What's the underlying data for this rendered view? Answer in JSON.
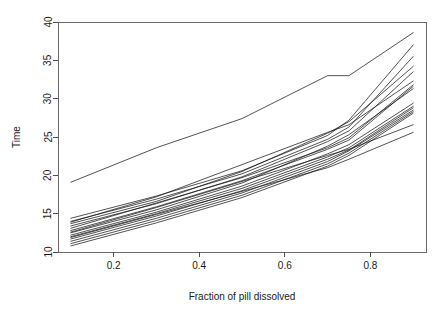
{
  "chart_data": {
    "type": "line",
    "title": "",
    "subtitle": "",
    "xlabel": "Fraction of pill dissolved",
    "ylabel": "Time",
    "xlim": [
      0.07,
      0.93
    ],
    "ylim": [
      10,
      40
    ],
    "xticks": [
      0.2,
      0.4,
      0.6,
      0.8
    ],
    "xticklabels": [
      "0.2",
      "0.4",
      "0.6",
      "0.8"
    ],
    "yticks": [
      10,
      15,
      20,
      25,
      30,
      35,
      40
    ],
    "yticklabels": [
      "10",
      "15",
      "20",
      "25",
      "30",
      "35",
      "40"
    ],
    "grid": false,
    "legend": null,
    "legend_position": "none",
    "box": true,
    "annotations": [],
    "x": [
      0.1,
      0.3,
      0.5,
      0.7,
      0.75,
      0.9
    ],
    "series": [
      {
        "name": "subject-01",
        "values": [
          19.1,
          23.6,
          27.4,
          33.0,
          33.0,
          38.6
        ]
      },
      {
        "name": "subject-02",
        "values": [
          14.4,
          17.3,
          20.6,
          25.2,
          27.2,
          37.0
        ]
      },
      {
        "name": "subject-03",
        "values": [
          14.0,
          16.9,
          20.2,
          24.7,
          26.3,
          35.5
        ]
      },
      {
        "name": "subject-04",
        "values": [
          13.7,
          16.6,
          20.5,
          25.5,
          27.0,
          34.2
        ]
      },
      {
        "name": "subject-05",
        "values": [
          13.4,
          16.3,
          19.8,
          24.4,
          25.8,
          33.5
        ]
      },
      {
        "name": "subject-06",
        "values": [
          13.9,
          17.2,
          21.4,
          25.6,
          26.6,
          32.3
        ]
      },
      {
        "name": "subject-07",
        "values": [
          13.1,
          16.4,
          19.7,
          23.6,
          24.9,
          31.8
        ]
      },
      {
        "name": "subject-08",
        "values": [
          12.8,
          15.9,
          19.3,
          23.4,
          24.6,
          31.6
        ]
      },
      {
        "name": "subject-09",
        "values": [
          12.5,
          15.5,
          19.0,
          23.8,
          25.3,
          31.3
        ]
      },
      {
        "name": "subject-10",
        "values": [
          12.2,
          15.2,
          18.6,
          22.8,
          24.0,
          29.4
        ]
      },
      {
        "name": "subject-11",
        "values": [
          12.0,
          15.0,
          18.3,
          22.4,
          23.6,
          29.0
        ]
      },
      {
        "name": "subject-12",
        "values": [
          11.7,
          14.7,
          18.0,
          22.1,
          23.3,
          28.8
        ]
      },
      {
        "name": "subject-13",
        "values": [
          11.4,
          14.4,
          17.7,
          21.8,
          23.2,
          28.5
        ]
      },
      {
        "name": "subject-14",
        "values": [
          11.1,
          14.1,
          17.4,
          21.5,
          22.9,
          28.3
        ]
      },
      {
        "name": "subject-15",
        "values": [
          12.6,
          15.8,
          19.2,
          22.6,
          23.4,
          26.6
        ]
      },
      {
        "name": "subject-16",
        "values": [
          11.9,
          14.9,
          17.9,
          21.0,
          22.1,
          25.6
        ]
      },
      {
        "name": "subject-17",
        "values": [
          10.8,
          13.8,
          17.1,
          21.2,
          22.6,
          28.1
        ]
      }
    ]
  }
}
